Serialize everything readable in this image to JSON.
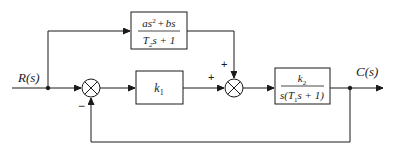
{
  "diagram": {
    "type": "control-system-block-diagram",
    "input": {
      "label": "R(s)"
    },
    "output": {
      "label": "C(s)"
    },
    "blocks": {
      "feedforward": {
        "numerator": "as² + bs",
        "numerator_parts": {
          "a": "a",
          "s": "s",
          "sq": "2",
          "plus": "+",
          "bs": "bs"
        },
        "denominator_parts": {
          "T": "T",
          "sub": "2",
          "rest": "s + 1"
        }
      },
      "controller": {
        "k": "k",
        "sub": "1"
      },
      "plant": {
        "numerator_parts": {
          "k": "k",
          "sub": "2"
        },
        "denominator_parts": {
          "pre": "s(T",
          "sub": "1",
          "post": "s + 1)"
        }
      }
    },
    "summing_junctions": {
      "sum1": {
        "signs": {
          "bottom": "−"
        }
      },
      "sum2": {
        "signs": {
          "left": "+",
          "top": "+"
        }
      }
    },
    "colors": {
      "stroke": "#1a1a1a",
      "background": "#ffffff"
    }
  }
}
